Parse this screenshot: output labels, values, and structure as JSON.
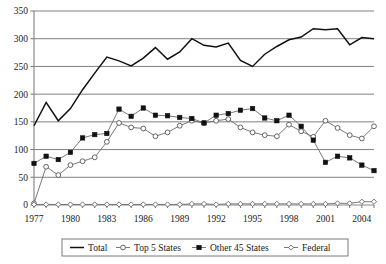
{
  "chart_data": {
    "type": "line",
    "title": "",
    "xlabel": "",
    "ylabel": "",
    "xlim": [
      1977,
      2005
    ],
    "ylim": [
      0,
      350
    ],
    "ytick_step": 50,
    "yticks": [
      0,
      50,
      100,
      150,
      200,
      250,
      300,
      350
    ],
    "xticks_labeled": [
      1977,
      1980,
      1983,
      1986,
      1989,
      1992,
      1995,
      1998,
      2001,
      2004
    ],
    "x": [
      1977,
      1978,
      1979,
      1980,
      1981,
      1982,
      1983,
      1984,
      1985,
      1986,
      1987,
      1988,
      1989,
      1990,
      1991,
      1992,
      1993,
      1994,
      1995,
      1996,
      1997,
      1998,
      1999,
      2000,
      2001,
      2002,
      2003,
      2004,
      2005
    ],
    "grid": "horizontal",
    "legend_position": "bottom",
    "series": [
      {
        "name": "Total",
        "marker": "none",
        "line": "solid",
        "color": "#111111",
        "values": [
          143,
          185,
          152,
          174,
          208,
          238,
          267,
          260,
          251,
          265,
          284,
          263,
          276,
          300,
          288,
          285,
          292,
          261,
          250,
          272,
          286,
          298,
          303,
          318,
          316,
          318,
          289,
          302,
          300
        ]
      },
      {
        "name": "Top 5 States",
        "marker": "open-circle",
        "line": "thin",
        "color": "#6b6b6b",
        "values": [
          3,
          69,
          54,
          72,
          79,
          86,
          114,
          148,
          140,
          138,
          124,
          131,
          143,
          152,
          148,
          152,
          155,
          140,
          131,
          126,
          124,
          145,
          133,
          123,
          152,
          139,
          126,
          120,
          142
        ]
      },
      {
        "name": "Other 45 States",
        "marker": "filled-square",
        "line": "thin",
        "color": "#111111",
        "values": [
          75,
          88,
          82,
          95,
          121,
          127,
          129,
          173,
          160,
          175,
          162,
          161,
          158,
          156,
          148,
          162,
          165,
          171,
          174,
          157,
          152,
          162,
          142,
          117,
          77,
          88,
          85,
          72,
          62
        ]
      },
      {
        "name": "Federal",
        "marker": "open-diamond",
        "line": "thin",
        "color": "#6b6b6b",
        "values": [
          1,
          1,
          1,
          1,
          1,
          1,
          1,
          1,
          1,
          1,
          1,
          1,
          1,
          2,
          2,
          1,
          2,
          2,
          2,
          2,
          2,
          2,
          2,
          2,
          2,
          3,
          3,
          6,
          6
        ]
      }
    ]
  },
  "axis": {
    "y_tick_labels": [
      "0",
      "50",
      "100",
      "150",
      "200",
      "250",
      "300",
      "350"
    ],
    "x_tick_labels": [
      "1977",
      "1980",
      "1983",
      "1986",
      "1989",
      "1992",
      "1995",
      "1998",
      "2001",
      "2004"
    ]
  },
  "legend": {
    "items": [
      {
        "label": "Total",
        "marker": "line"
      },
      {
        "label": "Top 5 States",
        "marker": "open-circle"
      },
      {
        "label": "Other 45 States",
        "marker": "filled-square"
      },
      {
        "label": "Federal",
        "marker": "open-diamond"
      }
    ]
  }
}
